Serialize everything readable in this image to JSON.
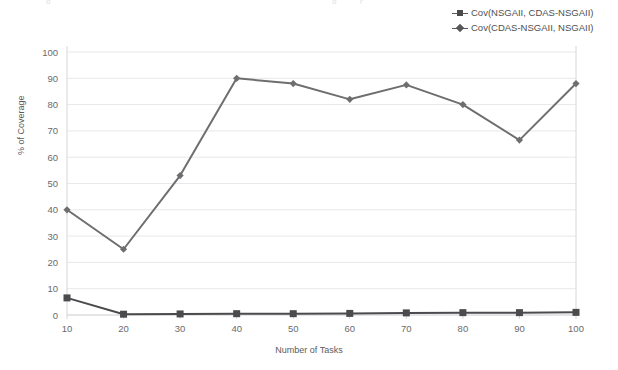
{
  "legend": {
    "position": "top-right",
    "items": [
      {
        "label": "Cov(NSGAII, CDAS-NSGAII)",
        "marker": "square-marker-icon"
      },
      {
        "label": "Cov(CDAS-NSGAII, NSGAII)",
        "marker": "diamond-marker-icon"
      }
    ]
  },
  "axes": {
    "ylabel": "% of Coverage",
    "xlabel": "Number of Tasks",
    "yticks": [
      "0",
      "10",
      "20",
      "30",
      "40",
      "50",
      "60",
      "70",
      "80",
      "90",
      "100"
    ],
    "xticks": [
      "10",
      "20",
      "30",
      "40",
      "50",
      "60",
      "70",
      "80",
      "90",
      "100"
    ]
  },
  "colors": {
    "series_1": "#4b4b4d",
    "series_2": "#6e6e70",
    "grid": "#e8e8ec",
    "axis": "#d6d6da",
    "text": "#5a5a5c"
  },
  "chart_data": {
    "type": "line",
    "title": "",
    "xlabel": "Number of Tasks",
    "ylabel": "% of Coverage",
    "x": [
      10,
      20,
      30,
      40,
      50,
      60,
      70,
      80,
      90,
      100
    ],
    "xlim": [
      10,
      100
    ],
    "ylim": [
      0,
      100
    ],
    "grid": true,
    "legend_position": "top-right",
    "series": [
      {
        "name": "Cov(NSGAII, CDAS-NSGAII)",
        "marker": "square",
        "color": "#4b4b4d",
        "values": [
          6.5,
          0.3,
          0.4,
          0.5,
          0.5,
          0.6,
          0.8,
          0.9,
          0.9,
          1.0
        ]
      },
      {
        "name": "Cov(CDAS-NSGAII, NSGAII)",
        "marker": "diamond",
        "color": "#6e6e70",
        "values": [
          40,
          25,
          53,
          90,
          88,
          82,
          87.5,
          80,
          66.5,
          88
        ]
      }
    ]
  }
}
